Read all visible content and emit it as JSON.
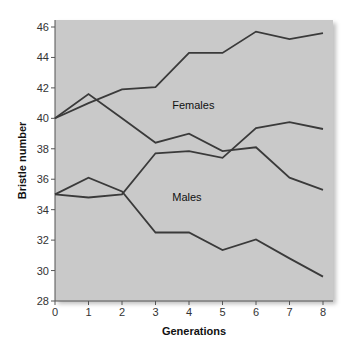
{
  "chart_data": {
    "type": "line",
    "title": "",
    "xlabel": "Generations",
    "ylabel": "Bristle number",
    "x": [
      0,
      1,
      2,
      3,
      4,
      5,
      6,
      7,
      8
    ],
    "xlim": [
      0,
      8
    ],
    "ylim": [
      28,
      46
    ],
    "xticks": [
      "0",
      "1",
      "2",
      "3",
      "4",
      "5",
      "6",
      "7",
      "8"
    ],
    "yticks": [
      "28",
      "30",
      "32",
      "34",
      "36",
      "38",
      "40",
      "42",
      "44",
      "46"
    ],
    "grid": false,
    "legend": "none",
    "annotations": [
      {
        "text": "Females",
        "x": 3.5,
        "y": 40.6
      },
      {
        "text": "Males",
        "x": 3.5,
        "y": 34.6
      }
    ],
    "series": [
      {
        "name": "Females (selected high)",
        "values": [
          40.0,
          41.0,
          41.9,
          42.05,
          44.3,
          44.3,
          45.7,
          45.2,
          45.6
        ]
      },
      {
        "name": "Females (selected low)",
        "values": [
          40.0,
          41.6,
          40.0,
          38.4,
          39.0,
          37.85,
          38.1,
          36.1,
          35.3
        ]
      },
      {
        "name": "Males (selected high)",
        "values": [
          35.0,
          34.8,
          35.0,
          37.7,
          37.85,
          37.4,
          39.35,
          39.75,
          39.3
        ]
      },
      {
        "name": "Males (selected low)",
        "values": [
          35.0,
          36.1,
          35.2,
          32.5,
          32.5,
          31.35,
          32.05,
          30.8,
          29.6
        ]
      }
    ],
    "colors": {
      "plot_background": "#c9c9c9",
      "line": "#3a3a3a",
      "axis": "#555555"
    }
  }
}
